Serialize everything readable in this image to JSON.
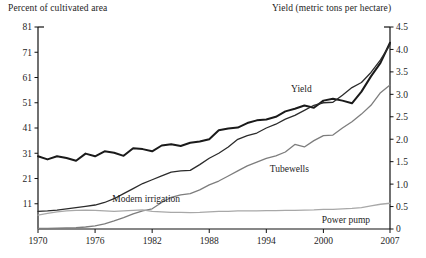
{
  "chart_data": {
    "type": "line",
    "title": "",
    "xlabel": "",
    "ylabel": "Percent of cultivated area",
    "y2label": "Yield (metric tons per hectare)",
    "grid": false,
    "legend_position": "inline-annotations",
    "xlim": [
      1970,
      2007
    ],
    "ylim": [
      1,
      81
    ],
    "y2lim": [
      0,
      4.5
    ],
    "xticks": [
      1970,
      1976,
      1982,
      1988,
      1994,
      2000,
      2007
    ],
    "xtick_labels": [
      "1970",
      "1976",
      "1982",
      "1988",
      "1994",
      "2000",
      "2007"
    ],
    "yticks": [
      11,
      21,
      31,
      41,
      51,
      61,
      71,
      81
    ],
    "ytick_labels": [
      "11",
      "21",
      "31",
      "41",
      "51",
      "61",
      "71",
      "81"
    ],
    "y2ticks": [
      0,
      0.5,
      1.0,
      1.5,
      2.0,
      2.5,
      3.0,
      3.5,
      4.0,
      4.5
    ],
    "y2tick_labels": [
      "0",
      "0.5",
      "1.0",
      "1.5",
      "2.0",
      "2.5",
      "3.0",
      "3.5",
      "4.0",
      "4.5"
    ],
    "x": [
      1970,
      1971,
      1972,
      1973,
      1974,
      1975,
      1976,
      1977,
      1978,
      1979,
      1980,
      1981,
      1982,
      1983,
      1984,
      1985,
      1986,
      1987,
      1988,
      1989,
      1990,
      1991,
      1992,
      1993,
      1994,
      1995,
      1996,
      1997,
      1998,
      1999,
      2000,
      2001,
      2002,
      2003,
      2004,
      2005,
      2006,
      2007
    ],
    "series": [
      {
        "name": "Yield",
        "axis": "right",
        "units": "metric tons per hectare",
        "color": "#1a1a1a",
        "width": 2.0,
        "label_x": 2000,
        "values": [
          1.62,
          1.55,
          1.62,
          1.58,
          1.52,
          1.68,
          1.62,
          1.73,
          1.7,
          1.63,
          1.8,
          1.78,
          1.73,
          1.86,
          1.89,
          1.85,
          1.92,
          1.95,
          2.0,
          2.2,
          2.24,
          2.26,
          2.36,
          2.42,
          2.44,
          2.5,
          2.62,
          2.68,
          2.75,
          2.7,
          2.86,
          2.9,
          2.86,
          2.8,
          3.06,
          3.4,
          3.7,
          4.15
        ]
      },
      {
        "name": "Modern irrigation",
        "axis": "left",
        "units": "percent of cultivated area",
        "color": "#2b2b2b",
        "width": 1.3,
        "label_x": 1982,
        "values": [
          8.0,
          8.2,
          8.5,
          9.0,
          9.5,
          10.0,
          10.5,
          11.5,
          13.0,
          15.0,
          17.0,
          19.0,
          20.5,
          22.0,
          23.5,
          24.0,
          24.2,
          26.5,
          29.0,
          31.0,
          33.5,
          36.5,
          38.0,
          39.0,
          41.0,
          42.5,
          44.5,
          46.0,
          48.0,
          50.0,
          51.0,
          51.2,
          54.0,
          57.0,
          59.0,
          63.0,
          68.0,
          74.0
        ]
      },
      {
        "name": "Tubewells",
        "axis": "left",
        "units": "percent of cultivated area",
        "color": "#7d7d7d",
        "width": 1.3,
        "label_x": 1996,
        "values": [
          1.2,
          1.2,
          1.3,
          1.4,
          1.5,
          1.8,
          2.2,
          3.0,
          4.2,
          5.5,
          7.0,
          8.2,
          9.0,
          11.5,
          13.5,
          14.5,
          15.0,
          16.5,
          18.5,
          20.0,
          22.0,
          24.0,
          26.0,
          27.5,
          29.0,
          30.0,
          31.5,
          34.5,
          33.5,
          36.0,
          38.0,
          38.2,
          41.0,
          43.5,
          46.5,
          50.0,
          55.0,
          58.0
        ]
      },
      {
        "name": "Power pump",
        "axis": "left",
        "units": "percent of cultivated area",
        "color": "#a8a8a8",
        "width": 1.3,
        "label_x": 2003,
        "values": [
          6.5,
          7.2,
          7.8,
          8.2,
          8.4,
          8.5,
          8.4,
          8.2,
          8.0,
          8.2,
          8.4,
          8.6,
          8.0,
          7.8,
          7.6,
          7.6,
          7.5,
          7.6,
          7.8,
          8.0,
          8.0,
          8.2,
          8.2,
          8.2,
          8.3,
          8.3,
          8.4,
          8.4,
          8.5,
          8.6,
          8.8,
          8.8,
          9.0,
          9.2,
          9.5,
          10.2,
          10.8,
          11.2
        ]
      }
    ],
    "annotations": [
      {
        "text": "Yield",
        "series": "Yield"
      },
      {
        "text": "Modern irrigation",
        "series": "Modern irrigation"
      },
      {
        "text": "Tubewells",
        "series": "Tubewells"
      },
      {
        "text": "Power pump",
        "series": "Power pump"
      }
    ]
  },
  "labels": {
    "left_axis_title": "Percent of cultivated area",
    "right_axis_title": "Yield (metric tons per hectare)",
    "series_yield": "Yield",
    "series_modern_irrigation": "Modern irrigation",
    "series_tubewells": "Tubewells",
    "series_power_pump": "Power pump"
  }
}
